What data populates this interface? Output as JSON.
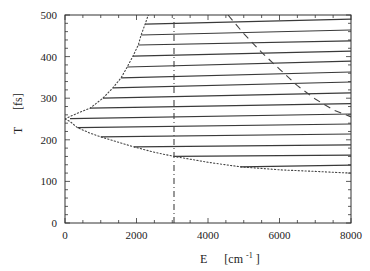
{
  "chart_data": {
    "type": "line",
    "title": "",
    "xlabel": "E",
    "xlabel_unit": "[cm",
    "xlabel_unit_sup": "-1",
    "xlabel_unit_close": "]",
    "ylabel": "T",
    "ylabel_unit": "[fs]",
    "xlim": [
      0,
      8000
    ],
    "ylim": [
      0,
      500
    ],
    "x_ticks": [
      0,
      2000,
      4000,
      6000,
      8000
    ],
    "y_ticks": [
      0,
      100,
      200,
      300,
      400,
      500
    ],
    "x_minor_step": 500,
    "y_minor_step": 20,
    "grid": false,
    "legend": null,
    "colors": {
      "axis": "#333333",
      "lines": "#3a3a3a",
      "boundary": "#444444"
    },
    "series": [
      {
        "name": "line-1",
        "style": "solid",
        "points": [
          [
            2240,
            478
          ],
          [
            8000,
            490
          ]
        ]
      },
      {
        "name": "line-2",
        "style": "solid",
        "points": [
          [
            2130,
            452
          ],
          [
            8000,
            464
          ]
        ]
      },
      {
        "name": "line-3",
        "style": "solid",
        "points": [
          [
            2050,
            428
          ],
          [
            8000,
            438
          ]
        ]
      },
      {
        "name": "line-4",
        "style": "solid",
        "points": [
          [
            1900,
            401
          ],
          [
            8000,
            413
          ]
        ]
      },
      {
        "name": "line-5",
        "style": "solid",
        "points": [
          [
            1740,
            375
          ],
          [
            8000,
            389
          ]
        ]
      },
      {
        "name": "line-6",
        "style": "solid",
        "points": [
          [
            1570,
            349
          ],
          [
            8000,
            363
          ]
        ]
      },
      {
        "name": "line-7",
        "style": "solid",
        "points": [
          [
            1340,
            325
          ],
          [
            8000,
            339
          ]
        ]
      },
      {
        "name": "line-8",
        "style": "solid",
        "points": [
          [
            1060,
            300
          ],
          [
            8000,
            313
          ]
        ]
      },
      {
        "name": "line-9",
        "style": "solid",
        "points": [
          [
            700,
            276
          ],
          [
            8000,
            287
          ]
        ]
      },
      {
        "name": "line-10",
        "style": "solid",
        "points": [
          [
            140,
            251
          ],
          [
            8000,
            262
          ]
        ]
      },
      {
        "name": "line-11",
        "style": "solid",
        "points": [
          [
            350,
            229
          ],
          [
            8000,
            238
          ]
        ]
      },
      {
        "name": "line-12",
        "style": "solid",
        "points": [
          [
            1000,
            207
          ],
          [
            8000,
            214
          ]
        ]
      },
      {
        "name": "line-13",
        "style": "solid",
        "points": [
          [
            1930,
            183
          ],
          [
            8000,
            188
          ]
        ]
      },
      {
        "name": "line-14",
        "style": "solid",
        "points": [
          [
            3050,
            160
          ],
          [
            8000,
            163
          ]
        ]
      },
      {
        "name": "line-15",
        "style": "solid",
        "points": [
          [
            4900,
            135
          ],
          [
            8000,
            139
          ]
        ]
      },
      {
        "name": "upper-boundary",
        "style": "dotted",
        "points": [
          [
            0,
            250
          ],
          [
            140,
            256
          ],
          [
            350,
            264
          ],
          [
            700,
            276
          ],
          [
            1060,
            300
          ],
          [
            1340,
            325
          ],
          [
            1570,
            349
          ],
          [
            1740,
            375
          ],
          [
            1900,
            401
          ],
          [
            2050,
            428
          ],
          [
            2130,
            452
          ],
          [
            2240,
            478
          ],
          [
            2330,
            500
          ]
        ]
      },
      {
        "name": "lower-boundary",
        "style": "dotted",
        "points": [
          [
            0,
            250
          ],
          [
            140,
            244
          ],
          [
            350,
            229
          ],
          [
            700,
            216
          ],
          [
            1000,
            207
          ],
          [
            1500,
            194
          ],
          [
            1930,
            183
          ],
          [
            2500,
            170
          ],
          [
            3050,
            160
          ],
          [
            4000,
            146
          ],
          [
            4900,
            135
          ],
          [
            6000,
            128
          ],
          [
            7000,
            124
          ],
          [
            8000,
            120
          ]
        ]
      },
      {
        "name": "vertical-dashdot",
        "style": "dash-dot",
        "points": [
          [
            3050,
            0
          ],
          [
            3050,
            500
          ]
        ]
      },
      {
        "name": "dashed-curve",
        "style": "dashed",
        "points": [
          [
            4560,
            500
          ],
          [
            5000,
            455
          ],
          [
            5500,
            410
          ],
          [
            6000,
            370
          ],
          [
            6500,
            330
          ],
          [
            7000,
            298
          ],
          [
            7500,
            272
          ],
          [
            8000,
            255
          ]
        ]
      }
    ]
  }
}
